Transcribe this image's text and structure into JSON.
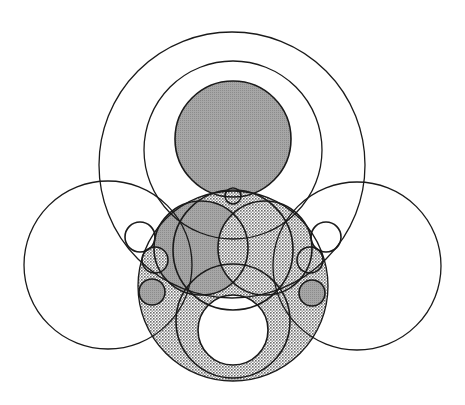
{
  "diagram": {
    "title": "",
    "width": 465,
    "height": 405,
    "colors": {
      "stroke": "#1a1a1a",
      "background": "#ffffff",
      "gray_fill": "#9a9a9a",
      "dot_fill": "#bdbdbd"
    },
    "circles": [
      {
        "id": "outer-large",
        "cx": 232,
        "cy": 165,
        "r": 133,
        "fill": "none"
      },
      {
        "id": "second-ring",
        "cx": 233,
        "cy": 150,
        "r": 89,
        "fill": "none"
      },
      {
        "id": "top-filled",
        "cx": 233,
        "cy": 139,
        "r": 58,
        "fill": "gray"
      },
      {
        "id": "tiny-top",
        "cx": 233,
        "cy": 196,
        "r": 8,
        "fill": "white"
      },
      {
        "id": "left-large",
        "cx": 108,
        "cy": 265,
        "r": 84,
        "fill": "none"
      },
      {
        "id": "right-large",
        "cx": 357,
        "cy": 266,
        "r": 84,
        "fill": "none"
      },
      {
        "id": "bottom-large-dotted",
        "cx": 233,
        "cy": 286,
        "r": 95,
        "fill": "dots"
      },
      {
        "id": "ring-outer",
        "cx": 233,
        "cy": 321,
        "r": 57,
        "fill": "dots"
      },
      {
        "id": "ring-hole",
        "cx": 233,
        "cy": 330,
        "r": 35,
        "fill": "white"
      },
      {
        "id": "middle-left-gray",
        "cx": 201,
        "cy": 248,
        "r": 47,
        "fill": "gray"
      },
      {
        "id": "middle-right-dotted",
        "cx": 265,
        "cy": 248,
        "r": 47,
        "fill": "dots"
      },
      {
        "id": "middle-band",
        "cx": 233,
        "cy": 250,
        "r": 60,
        "fill": "none"
      },
      {
        "id": "left-small-white",
        "cx": 140,
        "cy": 237,
        "r": 15,
        "fill": "white"
      },
      {
        "id": "left-small-dotted",
        "cx": 155,
        "cy": 260,
        "r": 13,
        "fill": "dots"
      },
      {
        "id": "left-small-gray",
        "cx": 152,
        "cy": 292,
        "r": 13,
        "fill": "gray"
      },
      {
        "id": "right-small-white",
        "cx": 326,
        "cy": 237,
        "r": 15,
        "fill": "white"
      },
      {
        "id": "right-small-dotted",
        "cx": 310,
        "cy": 260,
        "r": 13,
        "fill": "dots"
      },
      {
        "id": "right-small-gray",
        "cx": 312,
        "cy": 293,
        "r": 13,
        "fill": "gray"
      }
    ]
  }
}
